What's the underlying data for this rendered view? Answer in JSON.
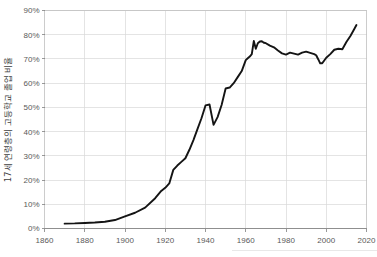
{
  "chart_data": {
    "type": "line",
    "title": "",
    "subtitle": "",
    "xlabel": "",
    "ylabel": "17세 연령층의 고등학교 졸업 비율",
    "xlim": [
      1860,
      2020
    ],
    "ylim": [
      0,
      0.9
    ],
    "xticks": [
      1860,
      1880,
      1900,
      1920,
      1940,
      1960,
      1980,
      2000,
      2020
    ],
    "xticklabels": [
      "1860",
      "1880",
      "1900",
      "1920",
      "1940",
      "1960",
      "1980",
      "2000",
      "2020"
    ],
    "yticks": [
      0,
      10,
      20,
      30,
      40,
      50,
      60,
      70,
      80,
      90
    ],
    "yticklabels": [
      "0%",
      "10%",
      "20%",
      "30%",
      "40%",
      "50%",
      "60%",
      "70%",
      "80%",
      "90%"
    ],
    "grid": true,
    "legend": false,
    "legend_position": "none",
    "line_color": "#141414",
    "grid_color": "#d9d9d9",
    "axis_color": "#808080",
    "tick_label_color": "#595959",
    "background_color": "#ffffff",
    "series": [
      {
        "name": "17세 연령층의 고등학교 졸업 비율",
        "x": [
          1870,
          1875,
          1880,
          1885,
          1890,
          1895,
          1900,
          1905,
          1910,
          1915,
          1918,
          1920,
          1922,
          1924,
          1926,
          1928,
          1930,
          1932,
          1934,
          1936,
          1938,
          1940,
          1942,
          1944,
          1946,
          1948,
          1950,
          1952,
          1954,
          1956,
          1958,
          1960,
          1961,
          1962,
          1963,
          1964,
          1965,
          1966,
          1967,
          1968,
          1969,
          1970,
          1972,
          1974,
          1976,
          1978,
          1980,
          1982,
          1984,
          1986,
          1988,
          1990,
          1992,
          1994,
          1995,
          1996,
          1997,
          1998,
          2000,
          2002,
          2004,
          2006,
          2008,
          2010,
          2012,
          2014,
          2015
        ],
        "y": [
          2.0,
          2.1,
          2.3,
          2.5,
          2.8,
          3.5,
          5.0,
          6.5,
          8.6,
          12.5,
          15.5,
          16.8,
          18.6,
          24.2,
          26.0,
          27.5,
          29.0,
          32.5,
          36.5,
          41.0,
          45.5,
          50.8,
          51.2,
          42.8,
          46.0,
          51.0,
          57.8,
          58.2,
          60.0,
          62.5,
          65.0,
          69.5,
          70.3,
          71.0,
          72.0,
          77.4,
          74.2,
          76.5,
          77.2,
          77.3,
          76.7,
          76.5,
          75.5,
          74.8,
          73.5,
          72.3,
          71.8,
          72.6,
          72.2,
          71.8,
          72.6,
          73.0,
          72.5,
          72.0,
          71.5,
          69.9,
          68.2,
          68.2,
          70.5,
          72.0,
          73.8,
          74.2,
          74.0,
          77.0,
          79.5,
          82.5,
          84.0
        ]
      }
    ]
  }
}
